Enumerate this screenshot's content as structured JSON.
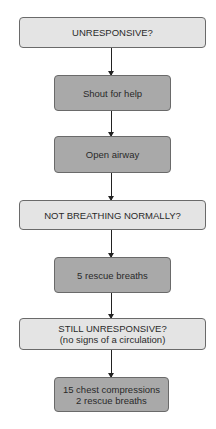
{
  "flowchart": {
    "nodes": [
      {
        "id": "unresponsive",
        "type": "decision",
        "lines": [
          "UNRESPONSIVE?"
        ]
      },
      {
        "id": "shout",
        "type": "action",
        "lines": [
          "Shout for help"
        ]
      },
      {
        "id": "airway",
        "type": "action",
        "lines": [
          "Open airway"
        ]
      },
      {
        "id": "not-breathing",
        "type": "decision",
        "lines": [
          "NOT BREATHING NORMALLY?"
        ]
      },
      {
        "id": "rescue-breaths",
        "type": "action",
        "lines": [
          "5 rescue breaths"
        ]
      },
      {
        "id": "still-unresponsive",
        "type": "decision",
        "lines": [
          "STILL UNRESPONSIVE?",
          "(no signs of a circulation)"
        ]
      },
      {
        "id": "compressions",
        "type": "action",
        "lines": [
          "15 chest compressions",
          "2 rescue breaths"
        ]
      }
    ],
    "edges": [
      [
        "unresponsive",
        "shout"
      ],
      [
        "shout",
        "airway"
      ],
      [
        "airway",
        "not-breathing"
      ],
      [
        "not-breathing",
        "rescue-breaths"
      ],
      [
        "rescue-breaths",
        "still-unresponsive"
      ],
      [
        "still-unresponsive",
        "compressions"
      ]
    ]
  },
  "colors": {
    "decision_fill": "#e4e4e4",
    "action_fill": "#a9a9a9",
    "border": "#6a6a6a",
    "arrow": "#222222"
  }
}
